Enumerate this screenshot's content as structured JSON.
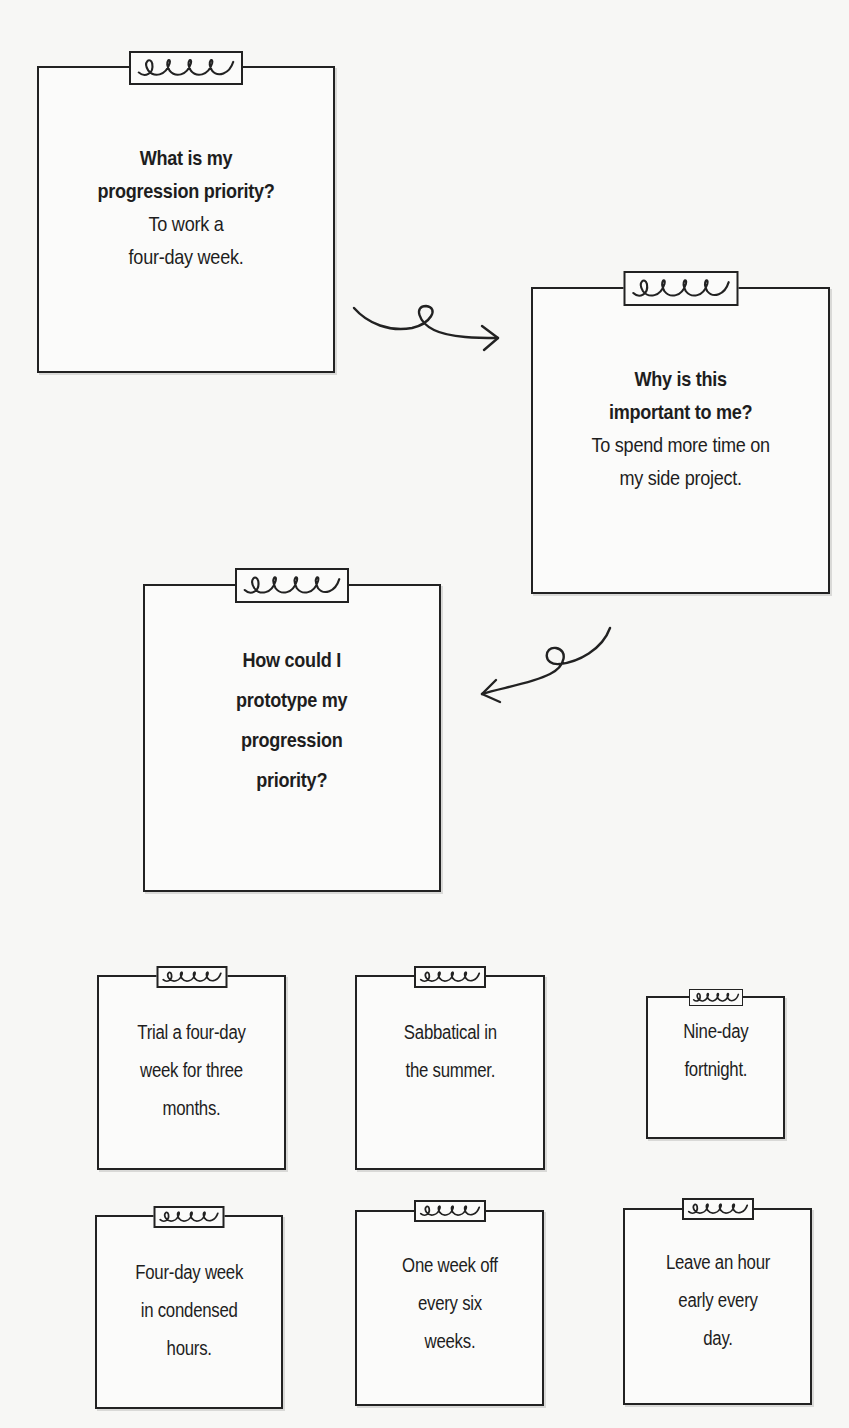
{
  "diagram": {
    "type": "flow",
    "background": "#f7f7f5",
    "stroke_color": "#222222",
    "steps": [
      {
        "id": "step-1",
        "question_lines": [
          "What is my",
          "progression priority?"
        ],
        "answer_lines": [
          "To work a",
          "four-day week."
        ]
      },
      {
        "id": "step-2",
        "question_lines": [
          "Why is this",
          "important to me?"
        ],
        "answer_lines": [
          "To spend more time on",
          "my side project."
        ]
      },
      {
        "id": "step-3",
        "question_lines": [
          "How could I",
          "prototype my",
          "progression",
          "priority?"
        ],
        "answer_lines": []
      }
    ],
    "arrows": [
      {
        "from": "step-1",
        "to": "step-2",
        "direction": "right",
        "icon": "curly-arrow-right-icon"
      },
      {
        "from": "step-2",
        "to": "step-3",
        "direction": "left",
        "icon": "curly-arrow-left-icon"
      }
    ],
    "options": [
      {
        "lines": [
          "Trial a four-day",
          "week for three",
          "months."
        ]
      },
      {
        "lines": [
          "Sabbatical in",
          "the summer."
        ]
      },
      {
        "lines": [
          "Nine-day",
          "fortnight."
        ]
      },
      {
        "lines": [
          "Four-day week",
          "in condensed",
          "hours."
        ]
      },
      {
        "lines": [
          "One week off",
          "every six",
          "weeks."
        ]
      },
      {
        "lines": [
          "Leave an hour",
          "early every",
          "day."
        ]
      }
    ],
    "clip_icon": "spring-clip-icon"
  }
}
